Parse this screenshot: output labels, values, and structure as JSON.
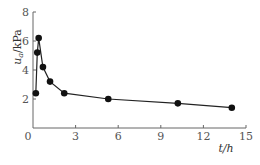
{
  "chart_data": {
    "type": "line",
    "title": "",
    "xlabel": "t/h",
    "ylabel": "u_a/kPa",
    "xlim": [
      0,
      15
    ],
    "ylim": [
      0,
      8
    ],
    "xticks": [
      "0",
      "3",
      "6",
      "9",
      "12",
      "15"
    ],
    "yticks": [
      "2",
      "4",
      "6",
      "8"
    ],
    "grid": false,
    "series": [
      {
        "name": "u_a",
        "x": [
          0.2,
          0.3,
          0.4,
          0.7,
          1.2,
          2.2,
          5.3,
          10.2,
          14.0
        ],
        "y": [
          2.4,
          5.2,
          6.2,
          4.2,
          3.2,
          2.4,
          2.0,
          1.7,
          1.4
        ]
      }
    ]
  },
  "labels": {
    "x_axis": "t/h",
    "y_axis_main": "u",
    "y_axis_sub": "a",
    "y_axis_unit": "/kPa",
    "origin": "0"
  }
}
